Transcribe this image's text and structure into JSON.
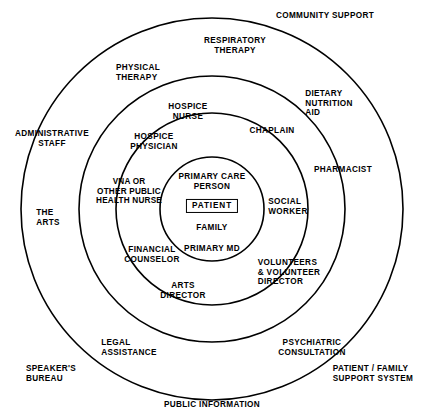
{
  "diagram": {
    "stroke_color": "#000000",
    "background_color": "#ffffff",
    "text_color": "#000000",
    "center": {
      "x": 212,
      "y": 209
    },
    "rings": [
      {
        "name": "core-circle",
        "radius": 52,
        "label": "Core / Patient unit"
      },
      {
        "name": "hospice-team-circle",
        "radius": 96,
        "label": "Hospice core team"
      },
      {
        "name": "extended-team-circle",
        "radius": 133,
        "label": "Extended team"
      },
      {
        "name": "community-circle",
        "radius": 191,
        "label": "Community"
      }
    ]
  },
  "core": {
    "primary_care_person": "PRIMARY CARE\nPERSON",
    "patient": "PATIENT",
    "family": "FAMILY",
    "primary_md": "PRIMARY MD"
  },
  "ring_hospice_team": [
    {
      "name": "hospice-nurse",
      "text": "HOSPICE\nNURSE",
      "x": 188,
      "y": 112
    },
    {
      "name": "hospice-physician",
      "text": "HOSPICE\nPHYSICIAN",
      "x": 154,
      "y": 142
    },
    {
      "name": "vna-public-health-nurse",
      "text": "VNA OR\nOTHER PUBLIC\nHEALTH NURSE",
      "x": 129,
      "y": 191
    },
    {
      "name": "financial-counselor",
      "text": "FINANCIAL\nCOUNSELOR",
      "x": 152,
      "y": 255
    },
    {
      "name": "arts-director",
      "text": "ARTS\nDIRECTOR",
      "x": 183,
      "y": 291
    },
    {
      "name": "volunteers-volunteer-director",
      "text": "VOLUNTEERS\n& VOLUNTEER\nDIRECTOR",
      "x": 289,
      "y": 272
    },
    {
      "name": "social-worker",
      "text": "SOCIAL\nWORKER",
      "x": 288,
      "y": 207
    },
    {
      "name": "chaplain",
      "text": "CHAPLAIN",
      "x": 272,
      "y": 131
    }
  ],
  "ring_extended_team": [
    {
      "name": "respiratory-therapy",
      "text": "RESPIRATORY\nTHERAPY",
      "x": 235,
      "y": 46
    },
    {
      "name": "physical-therapy",
      "text": "PHYSICAL\nTHERAPY",
      "x": 138,
      "y": 73
    },
    {
      "name": "dietary-nutrition-aid",
      "text": "DIETARY\nNUTRITION\nAID",
      "x": 329,
      "y": 103
    },
    {
      "name": "pharmacist",
      "text": "PHARMACIST",
      "x": 343,
      "y": 170
    },
    {
      "name": "psychiatric-consultation",
      "text": "PSYCHIATRIC\nCONSULTATION",
      "x": 312,
      "y": 348
    },
    {
      "name": "legal-assistance",
      "text": "LEGAL\nASSISTANCE",
      "x": 129,
      "y": 348
    },
    {
      "name": "the-arts",
      "text": "THE\nARTS",
      "x": 48,
      "y": 218
    },
    {
      "name": "administrative-staff",
      "text": "ADMINISTRATIVE\nSTAFF",
      "x": 52,
      "y": 139
    }
  ],
  "outer_labels": [
    {
      "name": "community-support",
      "text": "COMMUNITY SUPPORT",
      "x": 325,
      "y": 16
    },
    {
      "name": "speakers-bureau",
      "text": "SPEAKER'S\nBUREAU",
      "x": 51,
      "y": 374
    },
    {
      "name": "public-information",
      "text": "PUBLIC INFORMATION",
      "x": 212,
      "y": 405
    },
    {
      "name": "patient-family-support-system",
      "text": "PATIENT / FAMILY\nSUPPORT SYSTEM",
      "x": 373,
      "y": 374
    }
  ]
}
